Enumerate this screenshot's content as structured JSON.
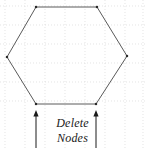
{
  "figure": {
    "name": "hexagon-delete-nodes-diagram",
    "width": 145,
    "height": 148,
    "background_color": "#ffffff"
  },
  "grid": {
    "visible": true,
    "style": "dotted",
    "color": "#d8d8d8",
    "vertical_lines_x": [
      5,
      25,
      45,
      65,
      85,
      105,
      125,
      143
    ],
    "horizontal_lines_y": [
      6,
      25,
      44,
      63,
      82,
      101
    ]
  },
  "shape": {
    "type": "hexagon",
    "stroke_color": "#5a5a5a",
    "stroke_width": 1,
    "fill": "none",
    "vertex_marker_color": "#2a2a2a",
    "vertex_marker_size": 2.2,
    "vertices": [
      {
        "label": "top-left",
        "x": 36,
        "y": 7
      },
      {
        "label": "top-right",
        "x": 97,
        "y": 7
      },
      {
        "label": "right",
        "x": 127,
        "y": 56
      },
      {
        "label": "bottom-right",
        "x": 96,
        "y": 104
      },
      {
        "label": "bottom-left",
        "x": 36,
        "y": 104
      },
      {
        "label": "left",
        "x": 7,
        "y": 57
      }
    ]
  },
  "annotations": {
    "arrows": [
      {
        "name": "left-delete-arrow",
        "direction": "up",
        "color": "#1a1a1a",
        "tail_x": 36,
        "tail_y": 148,
        "head_x": 36,
        "head_y": 110
      },
      {
        "name": "right-delete-arrow",
        "direction": "up",
        "color": "#1a1a1a",
        "tail_x": 96,
        "tail_y": 148,
        "head_x": 96,
        "head_y": 110
      }
    ],
    "caption": {
      "line1": "Delete",
      "line2": "Nodes",
      "style": "italic",
      "color": "#1a1a1a"
    }
  }
}
